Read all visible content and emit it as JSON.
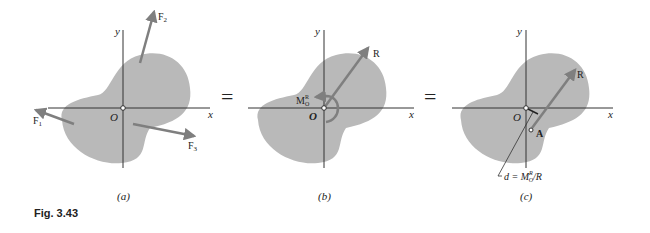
{
  "figure": {
    "caption": "Fig. 3.43",
    "equals_sign": "=",
    "colors": {
      "body_fill": "#b9b9b9",
      "arrow": "#7f7f7f",
      "axis": "#333333",
      "text": "#222222"
    },
    "panels": [
      {
        "id": "a",
        "label": "(a)",
        "axis_x": "x",
        "axis_y": "y",
        "origin": "O",
        "forces": [
          {
            "name": "F",
            "sub": "1"
          },
          {
            "name": "F",
            "sub": "2"
          },
          {
            "name": "F",
            "sub": "3"
          }
        ]
      },
      {
        "id": "b",
        "label": "(b)",
        "axis_x": "x",
        "axis_y": "y",
        "origin": "O",
        "resultant": "R",
        "moment": {
          "name": "M",
          "sub": "O",
          "sup": "R"
        }
      },
      {
        "id": "c",
        "label": "(c)",
        "axis_x": "x",
        "axis_y": "y",
        "origin": "O",
        "resultant": "R",
        "point": "A",
        "distance": {
          "lhs": "d = M",
          "sub": "O",
          "sup": "R",
          "rhs": "/R"
        }
      }
    ]
  }
}
